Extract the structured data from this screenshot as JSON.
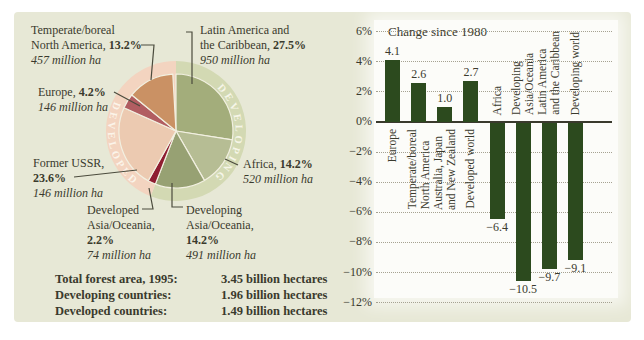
{
  "panel": {
    "bg": "#e7e8d6",
    "text_color": "#3a3a2d"
  },
  "pie_section": {
    "callouts": {
      "north_america": {
        "line1": "Temperate/boreal",
        "line2": "North America, ",
        "pct": "13.2%",
        "area": "457 million ha"
      },
      "latin_america": {
        "line1": "Latin America and",
        "line2": "the Caribbean, ",
        "pct": "27.5%",
        "area": "950 million ha"
      },
      "europe": {
        "line1": "Europe, ",
        "pct": "4.2%",
        "area": "146 million ha"
      },
      "former_ussr": {
        "line1": "Former USSR,",
        "pct": "23.6%",
        "area": "146 million ha"
      },
      "developed_asia": {
        "line1": "Developed",
        "line2": "Asia/Oceania,",
        "pct": "2.2%",
        "area": "74 million ha"
      },
      "developing_asia": {
        "line1": "Developing",
        "line2": "Asia/Oceania,",
        "pct": "14.2%",
        "area": "491 million ha"
      },
      "africa": {
        "line1": "Africa, ",
        "pct": "14.2%",
        "area": "520 million ha"
      }
    },
    "totals": {
      "rows": [
        {
          "label": "Total forest area, 1995:",
          "value": "3.45 billion hectares"
        },
        {
          "label": "Developing countries:",
          "value": "1.96 billion hectares"
        },
        {
          "label": "Developed countries:",
          "value": "1.49 billion hectares"
        }
      ]
    }
  },
  "chart_data": [
    {
      "type": "pie",
      "unit": "%",
      "slices": [
        {
          "label": "Latin America and the Caribbean",
          "value": 27.5,
          "area": "950 million ha",
          "color": "#a3ad7b"
        },
        {
          "label": "Africa",
          "value": 14.2,
          "area": "520 million ha",
          "color": "#b6bd94"
        },
        {
          "label": "Developing Asia/Oceania",
          "value": 14.2,
          "area": "491 million ha",
          "color": "#97a173"
        },
        {
          "label": "Developed Asia/Oceania",
          "value": 2.2,
          "area": "74 million ha",
          "color": "#8f1e31"
        },
        {
          "label": "Former USSR",
          "value": 23.6,
          "area": "146 million ha",
          "color": "#eccab1"
        },
        {
          "label": "Europe",
          "value": 4.2,
          "area": "146 million ha",
          "color": "#b15d61"
        },
        {
          "label": "Temperate/boreal North America",
          "value": 13.2,
          "area": "457 million ha",
          "color": "#ca9164"
        }
      ],
      "ring": {
        "developing": {
          "label": "DEVELOPING",
          "color": "#d3d9b3",
          "pct": 55.9
        },
        "developed": {
          "label": "DEVELOPED",
          "color": "#f3d4c0",
          "pct": 43.2
        }
      },
      "slice_border_color": "#f2f0e1"
    },
    {
      "type": "bar",
      "title": "Change since 1980",
      "categories": [
        "Europe",
        "Temperate/boreal\nNorth America",
        "Australia, Japan\nand New Zealand",
        "Developed world",
        "Africa",
        "Developing\nAsia/Oceania",
        "Latin America\nand the Caribbean",
        "Developing world"
      ],
      "values": [
        4.1,
        2.6,
        1.0,
        2.7,
        -6.4,
        -10.5,
        -9.7,
        -9.1
      ],
      "value_labels": [
        "4.1",
        "2.6",
        "1.0",
        "2.7",
        "−6.4",
        "−10.5",
        "−9.7",
        "−9.1"
      ],
      "ylim": [
        -12,
        6
      ],
      "ytick_step": 2,
      "ytick_labels": [
        "6%",
        "4%",
        "2%",
        "0%",
        "−2%",
        "−4%",
        "−6%",
        "−8%",
        "−10%",
        "−12%"
      ],
      "bar_color": "#2c4a1e",
      "grid": "dotted",
      "xlabel": "",
      "ylabel": ""
    }
  ]
}
